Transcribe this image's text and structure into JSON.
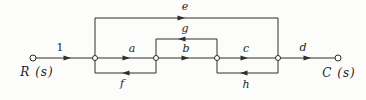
{
  "figure": {
    "type": "signal-flow-graph",
    "colors": {
      "line": "#2e2e2e",
      "text": "#1e1e1e",
      "background": "#fcfcfa"
    },
    "labels": {
      "input": "R (s)",
      "output": "C (s)"
    },
    "gains": {
      "unity": "1",
      "a": "a",
      "b": "b",
      "c": "c",
      "d": "d",
      "e": "e",
      "f": "f",
      "g": "g",
      "h": "h"
    },
    "graph": {
      "nodes": [
        "R(s)",
        "node1",
        "node2",
        "node3",
        "node4",
        "C(s)"
      ],
      "edges": [
        {
          "from": "R(s)",
          "to": "node1",
          "gain": "1",
          "path": "forward-main-line"
        },
        {
          "from": "node1",
          "to": "node2",
          "gain": "a",
          "path": "forward-main-line"
        },
        {
          "from": "node2",
          "to": "node3",
          "gain": "b",
          "path": "forward-main-line"
        },
        {
          "from": "node3",
          "to": "node4",
          "gain": "c",
          "path": "forward-main-line"
        },
        {
          "from": "node4",
          "to": "C(s)",
          "gain": "d",
          "path": "forward-main-line"
        },
        {
          "from": "node1",
          "to": "node4",
          "gain": "e",
          "path": "feedforward-top"
        },
        {
          "from": "node3",
          "to": "node2",
          "gain": "g",
          "path": "feedback-upper"
        },
        {
          "from": "node2",
          "to": "node1",
          "gain": "f",
          "path": "feedback-lower-left"
        },
        {
          "from": "node4",
          "to": "node3",
          "gain": "h",
          "path": "feedback-lower-right"
        }
      ]
    }
  }
}
